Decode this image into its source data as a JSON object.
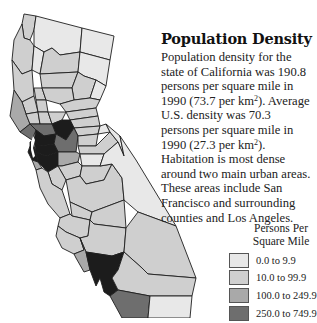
{
  "title": "Population Density",
  "description": {
    "p1": "Population density for the state of California was 190.8 persons per square mile in 1990 (73.7 per km",
    "p1_sup": "2",
    "p2": "). Average U.S. density was 70.3 persons per square mile in 1990 (27.3 per km",
    "p2_sup": "2",
    "p3": "). Habitation is most dense around two main urban areas. These areas include San Francisco and surrounding counties and Los Angeles."
  },
  "legend": {
    "title_line1": "Persons Per",
    "title_line2": "Square Mile",
    "items": [
      {
        "label": "0.0 to 9.9",
        "color": "#e8e8e8"
      },
      {
        "label": "10.0 to 99.9",
        "color": "#cfcfcf"
      },
      {
        "label": "100.0 to 249.9",
        "color": "#a9a9a9"
      },
      {
        "label": "250.0 to 749.9",
        "color": "#6e6e6e"
      }
    ]
  },
  "map": {
    "region": "California",
    "classes": {
      "very_low": "#e8e8e8",
      "low": "#cfcfcf",
      "medium": "#a9a9a9",
      "high": "#6e6e6e",
      "very_high": "#1c1c1c"
    }
  }
}
